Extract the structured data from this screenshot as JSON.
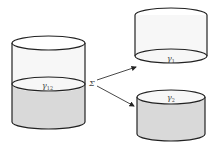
{
  "diagram": {
    "colors": {
      "stroke": "#222222",
      "light_fill": "#f7f7f7",
      "dark_fill": "#d9d9d9",
      "top_fill": "#ffffff"
    },
    "left_cylinder": {
      "interface_label": "γ",
      "interface_subscript": "12"
    },
    "operator_label": "Σ",
    "top_right_cylinder": {
      "interface_label": "γ",
      "interface_subscript": "1"
    },
    "bottom_right_cylinder": {
      "interface_label": "γ",
      "interface_subscript": "2"
    }
  }
}
